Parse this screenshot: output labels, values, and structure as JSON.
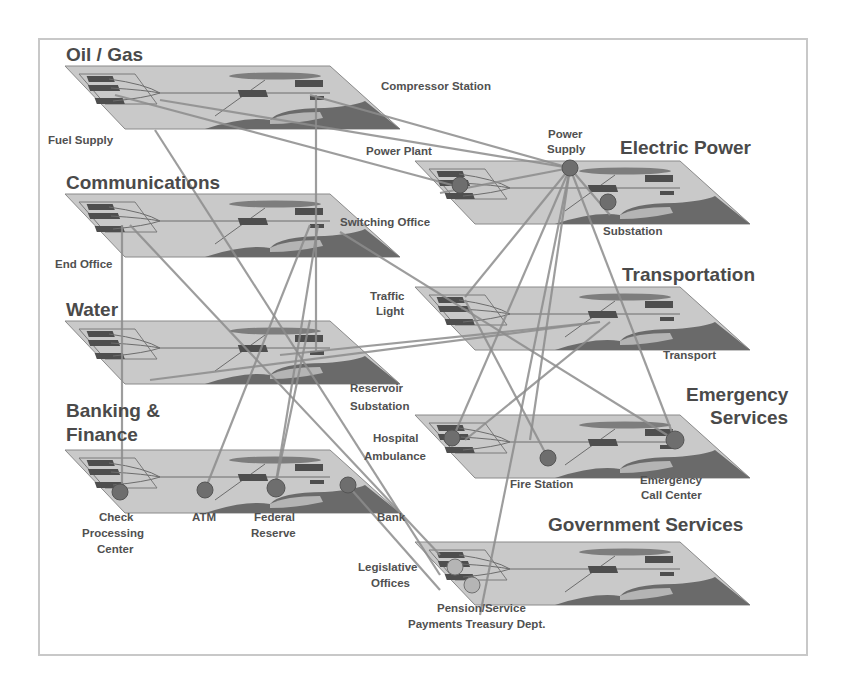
{
  "diagram": {
    "type": "infrastructure-interdependency",
    "frame_color": "#c8c8c8",
    "plane_color": "#c9c9c9",
    "link_color": "#8c8c8c",
    "node_color": "#6e6e6e",
    "layers": [
      {
        "id": "oil_gas",
        "title": "Oil / Gas",
        "x": 68,
        "y": 65,
        "labels": [
          "Compressor Station",
          "Fuel Supply"
        ]
      },
      {
        "id": "electric_power",
        "title": "Electric Power",
        "x": 418,
        "y": 160,
        "labels": [
          "Power Plant",
          "Power Supply",
          "Substation"
        ]
      },
      {
        "id": "communications",
        "title": "Communications",
        "x": 68,
        "y": 193,
        "labels": [
          "Switching Office",
          "End Office"
        ]
      },
      {
        "id": "transportation",
        "title": "Transportation",
        "x": 418,
        "y": 286,
        "labels": [
          "Traffic Light",
          "Transport"
        ]
      },
      {
        "id": "water",
        "title": "Water",
        "x": 68,
        "y": 320,
        "labels": [
          "Reservoir Substation"
        ]
      },
      {
        "id": "emergency_services",
        "title": "Emergency Services",
        "x": 418,
        "y": 414,
        "labels": [
          "Hospital Ambulance",
          "Fire Station",
          "Emergency Call Center"
        ]
      },
      {
        "id": "banking_finance",
        "title": "Banking & Finance",
        "x": 68,
        "y": 449,
        "labels": [
          "Check Processing Center",
          "ATM",
          "Federal Reserve",
          "Bank"
        ]
      },
      {
        "id": "government_services",
        "title": "Government Services",
        "x": 418,
        "y": 541,
        "labels": [
          "Legislative Offices",
          "Pension/Service Payments Treasury Dept."
        ]
      }
    ],
    "titles": {
      "oil_gas": "Oil / Gas",
      "electric_power": "Electric Power",
      "communications": "Communications",
      "transportation": "Transportation",
      "water": "Water",
      "emergency_1": "Emergency",
      "emergency_2": "Services",
      "banking_1": "Banking &",
      "banking_2": "Finance",
      "government_services": "Government Services"
    },
    "labels": {
      "compressor_station": "Compressor Station",
      "fuel_supply": "Fuel Supply",
      "power_plant": "Power Plant",
      "power_supply_1": "Power",
      "power_supply_2": "Supply",
      "substation": "Substation",
      "switching_office": "Switching Office",
      "end_office": "End Office",
      "traffic_1": "Traffic",
      "traffic_2": "Light",
      "transport": "Transport",
      "reservoir_1": "Reservoir",
      "reservoir_2": "Substation",
      "hospital_1": "Hospital",
      "hospital_2": "Ambulance",
      "fire_station": "Fire Station",
      "ecc_1": "Emergency",
      "ecc_2": "Call Center",
      "check_1": "Check",
      "check_2": "Processing",
      "check_3": "Center",
      "atm": "ATM",
      "fed_1": "Federal",
      "fed_2": "Reserve",
      "bank": "Bank",
      "legis_1": "Legislative",
      "legis_2": "Offices",
      "pension_1": "Pension/Service",
      "pension_2": "Payments Treasury Dept."
    }
  }
}
